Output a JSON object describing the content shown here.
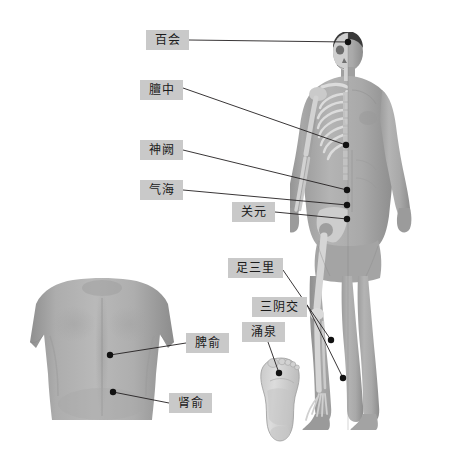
{
  "page": {
    "background_color": "#ffffff",
    "label_box_color": "#c9c9c9",
    "leader_line_color": "#231f20",
    "point_color": "#111111",
    "width": 472,
    "height": 455
  },
  "figures": [
    {
      "id": "front-body",
      "name": "anterior-body-skeleton-overlay",
      "description": "正面人体，左半身骨骼透视，右半身体表"
    },
    {
      "id": "back-panel",
      "name": "posterior-back-torso",
      "description": "背部视图"
    },
    {
      "id": "foot-sole",
      "name": "foot-sole-plantar",
      "description": "足底视图"
    }
  ],
  "acupoints": [
    {
      "id": "baihui",
      "label": "百会",
      "figure": "front-body",
      "chip": {
        "x": 146,
        "y": 30,
        "w": 43,
        "h": 20
      },
      "point": {
        "x": 348,
        "y": 42
      },
      "leader": [
        [
          189,
          40
        ],
        [
          348,
          42
        ]
      ]
    },
    {
      "id": "danzhong",
      "label": "膻中",
      "figure": "front-body",
      "chip": {
        "x": 140,
        "y": 80,
        "w": 43,
        "h": 20
      },
      "point": {
        "x": 346,
        "y": 145
      },
      "leader": [
        [
          183,
          88
        ],
        [
          346,
          145
        ]
      ]
    },
    {
      "id": "shenque",
      "label": "神阙",
      "figure": "front-body",
      "chip": {
        "x": 140,
        "y": 140,
        "w": 43,
        "h": 20
      },
      "point": {
        "x": 347,
        "y": 190
      },
      "leader": [
        [
          183,
          150
        ],
        [
          347,
          190
        ]
      ]
    },
    {
      "id": "qihai",
      "label": "气海",
      "figure": "front-body",
      "chip": {
        "x": 140,
        "y": 180,
        "w": 43,
        "h": 20
      },
      "point": {
        "x": 347,
        "y": 205
      },
      "leader": [
        [
          183,
          190
        ],
        [
          347,
          205
        ]
      ]
    },
    {
      "id": "guanyuan",
      "label": "关元",
      "figure": "front-body",
      "chip": {
        "x": 232,
        "y": 202,
        "w": 43,
        "h": 20
      },
      "point": {
        "x": 347,
        "y": 219
      },
      "leader": [
        [
          275,
          212
        ],
        [
          347,
          219
        ]
      ]
    },
    {
      "id": "zusanli",
      "label": "足三里",
      "figure": "front-body",
      "chip": {
        "x": 228,
        "y": 258,
        "w": 55,
        "h": 20
      },
      "point": {
        "x": 331,
        "y": 340
      },
      "leader": [
        [
          283,
          270
        ],
        [
          331,
          340
        ]
      ]
    },
    {
      "id": "sanyinjiao",
      "label": "三阴交",
      "figure": "front-body",
      "chip": {
        "x": 252,
        "y": 297,
        "w": 55,
        "h": 20
      },
      "point": {
        "x": 343,
        "y": 378
      },
      "leader": [
        [
          307,
          305
        ],
        [
          343,
          378
        ]
      ]
    },
    {
      "id": "yongquan",
      "label": "涌泉",
      "figure": "foot-sole",
      "chip": {
        "x": 242,
        "y": 322,
        "w": 43,
        "h": 20
      },
      "point": {
        "x": 279,
        "y": 373
      },
      "leader": [
        [
          268,
          342
        ],
        [
          279,
          373
        ]
      ]
    },
    {
      "id": "piyu",
      "label": "脾俞",
      "figure": "back-panel",
      "chip": {
        "x": 186,
        "y": 333,
        "w": 43,
        "h": 20
      },
      "point": {
        "x": 110,
        "y": 355
      },
      "leader": [
        [
          186,
          343
        ],
        [
          110,
          355
        ]
      ]
    },
    {
      "id": "shenyu",
      "label": "肾俞",
      "figure": "back-panel",
      "chip": {
        "x": 169,
        "y": 393,
        "w": 43,
        "h": 20
      },
      "point": {
        "x": 113,
        "y": 392
      },
      "leader": [
        [
          169,
          403
        ],
        [
          113,
          392
        ]
      ]
    }
  ]
}
